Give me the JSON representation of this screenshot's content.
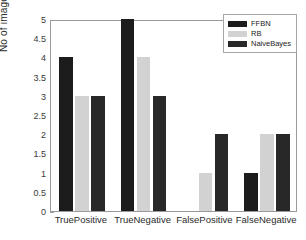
{
  "chart_data": {
    "type": "bar",
    "title": "",
    "xlabel": "",
    "ylabel": "No of image",
    "ylim": [
      0,
      5
    ],
    "ytick_step": 0.5,
    "grid": false,
    "legend_position": "top-right",
    "categories": [
      "TruePositive",
      "TrueNegative",
      "FalsePositive",
      "FalseNegative"
    ],
    "series": [
      {
        "name": "FFBN",
        "color": "#1c1c1c",
        "values": [
          4,
          5,
          0,
          1
        ]
      },
      {
        "name": "RB",
        "color": "#d2d2d2",
        "values": [
          3,
          4,
          1,
          2
        ]
      },
      {
        "name": "NaiveBayes",
        "color": "#282828",
        "values": [
          3,
          3,
          2,
          2
        ]
      }
    ],
    "ytick_labels": [
      "0",
      "0.5",
      "1",
      "1.5",
      "2",
      "2.5",
      "3",
      "3.5",
      "4",
      "4.5",
      "5"
    ]
  },
  "axes": {
    "y_label": "No of image",
    "y_ticks": [
      "5",
      "4.5",
      "4",
      "3.5",
      "3",
      "2.5",
      "2",
      "1.5",
      "1",
      "0.5",
      "0"
    ],
    "x_ticks": [
      "TruePositive",
      "TrueNegative",
      "FalsePositive",
      "FalseNegative"
    ]
  },
  "legend": {
    "entries": [
      {
        "label": "FFBN"
      },
      {
        "label": "RB"
      },
      {
        "label": "NaiveBayes"
      }
    ]
  }
}
